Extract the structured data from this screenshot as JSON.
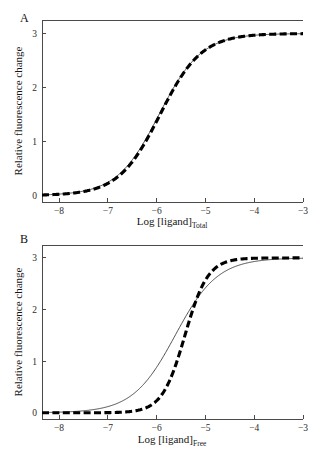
{
  "figure": {
    "background": "#ffffff",
    "panels": [
      {
        "id": "A",
        "label": "A",
        "xlabel_main": "Log [ligand]",
        "xlabel_sub": "Total",
        "ylabel": "Relative fluorescence change"
      },
      {
        "id": "B",
        "label": "B",
        "xlabel_main": "Log [ligand]",
        "xlabel_sub": "Free",
        "ylabel": "Relative fluorescence change"
      }
    ]
  },
  "chart_data": [
    {
      "type": "line",
      "panel": "A",
      "title": "",
      "xlabel": "Log [ligand]Total",
      "ylabel": "Relative fluorescence change",
      "xlim": [
        -8.35,
        -3.0
      ],
      "ylim": [
        -0.12,
        3.25
      ],
      "xticks": [
        -8,
        -7,
        -6,
        -5,
        -4,
        -3
      ],
      "xticklabels": [
        "−8",
        "−7",
        "−6",
        "−5",
        "−4",
        "−3"
      ],
      "yticks": [
        0,
        1,
        2,
        3
      ],
      "yticklabels": [
        "0",
        "1",
        "2",
        "3"
      ],
      "grid": false,
      "legend": "none",
      "series": [
        {
          "name": "solid-thin-curve",
          "style": "solid",
          "linewidth": 0.9,
          "color": "#3a3a3a",
          "model": "sigmoid",
          "top": 3.0,
          "bottom": 0.0,
          "logEC50": -5.95,
          "hill": 1.0,
          "x": [
            -8.35,
            -8.0,
            -7.75,
            -7.5,
            -7.25,
            -7.0,
            -6.75,
            -6.5,
            -6.25,
            -6.0,
            -5.75,
            -5.5,
            -5.25,
            -5.0,
            -4.75,
            -4.5,
            -4.25,
            -4.0,
            -3.75,
            -3.5,
            -3.25,
            -3.0
          ],
          "y": [
            0.06,
            0.13,
            0.23,
            0.39,
            0.66,
            0.89,
            1.23,
            1.59,
            1.95,
            2.26,
            2.52,
            2.71,
            2.83,
            2.91,
            2.95,
            2.97,
            2.98,
            2.99,
            2.99,
            3.0,
            3.0,
            3.0
          ]
        },
        {
          "name": "dashed-thick-curve",
          "style": "dashed",
          "linewidth": 3.1,
          "color": "#000000",
          "dash_pattern": [
            7,
            3.4
          ],
          "model": "sigmoid",
          "top": 3.0,
          "bottom": 0.0,
          "logEC50": -5.93,
          "hill": 1.02,
          "x": [
            -8.35,
            -8.0,
            -7.75,
            -7.5,
            -7.25,
            -7.0,
            -6.75,
            -6.5,
            -6.25,
            -6.0,
            -5.75,
            -5.5,
            -5.25,
            -5.0,
            -4.75,
            -4.5,
            -4.25,
            -4.0,
            -3.75,
            -3.5,
            -3.25,
            -3.0
          ],
          "y": [
            0.05,
            0.12,
            0.21,
            0.37,
            0.63,
            0.87,
            1.21,
            1.58,
            1.95,
            2.27,
            2.54,
            2.73,
            2.85,
            2.92,
            2.96,
            2.98,
            2.99,
            2.99,
            3.0,
            3.0,
            3.0,
            3.0
          ]
        }
      ],
      "annotation": "Solid thin and thick dashed curves nearly superimpose across the full range."
    },
    {
      "type": "line",
      "panel": "B",
      "title": "",
      "xlabel": "Log [ligand]Free",
      "ylabel": "Relative fluorescence change",
      "xlim": [
        -8.35,
        -3.0
      ],
      "ylim": [
        -0.12,
        3.25
      ],
      "xticks": [
        -8,
        -7,
        -6,
        -5,
        -4,
        -3
      ],
      "xticklabels": [
        "−8",
        "−7",
        "−6",
        "−5",
        "−4",
        "−3"
      ],
      "yticks": [
        0,
        1,
        2,
        3
      ],
      "yticklabels": [
        "0",
        "1",
        "2",
        "3"
      ],
      "grid": false,
      "legend": "none",
      "series": [
        {
          "name": "solid-thin-curve",
          "style": "solid",
          "linewidth": 0.9,
          "color": "#3a3a3a",
          "model": "sigmoid",
          "top": 3.0,
          "bottom": 0.0,
          "logEC50": -5.62,
          "hill": 1.0,
          "x": [
            -8.35,
            -8.0,
            -7.75,
            -7.5,
            -7.25,
            -7.0,
            -6.75,
            -6.5,
            -6.25,
            -6.0,
            -5.75,
            -5.5,
            -5.25,
            -5.0,
            -4.75,
            -4.5,
            -4.25,
            -4.0,
            -3.75,
            -3.5,
            -3.25,
            -3.0
          ],
          "y": [
            0.04,
            0.07,
            0.12,
            0.21,
            0.36,
            0.58,
            0.86,
            1.18,
            1.52,
            1.86,
            2.17,
            2.43,
            2.62,
            2.76,
            2.86,
            2.92,
            2.95,
            2.97,
            2.98,
            2.99,
            3.0,
            3.0
          ]
        },
        {
          "name": "dashed-thick-curve",
          "style": "dashed",
          "linewidth": 3.1,
          "color": "#000000",
          "dash_pattern": [
            7,
            3.4
          ],
          "model": "sigmoid",
          "top": 3.0,
          "bottom": 0.0,
          "logEC50": -5.42,
          "hill": 1.85,
          "x": [
            -8.35,
            -8.0,
            -7.75,
            -7.5,
            -7.25,
            -7.0,
            -6.75,
            -6.5,
            -6.25,
            -6.0,
            -5.75,
            -5.5,
            -5.25,
            -5.0,
            -4.75,
            -4.5,
            -4.25,
            -4.0,
            -3.75,
            -3.5,
            -3.25,
            -3.0
          ],
          "y": [
            0.0,
            0.01,
            0.02,
            0.03,
            0.06,
            0.11,
            0.19,
            0.33,
            0.56,
            0.9,
            1.35,
            1.85,
            2.3,
            2.62,
            2.8,
            2.9,
            2.95,
            2.97,
            2.99,
            2.99,
            3.0,
            3.0
          ]
        }
      ],
      "annotation": "Thick dashed curve is steeper and right-shifted, crossing the thin solid curve near y=1.7 around x=-5.3."
    }
  ]
}
